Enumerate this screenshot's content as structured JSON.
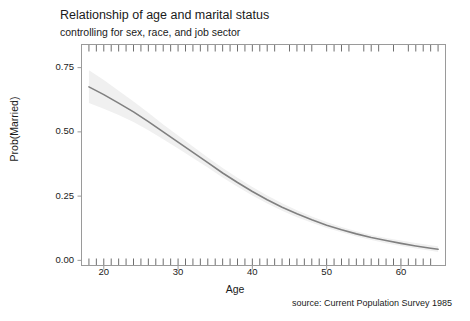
{
  "chart_data": {
    "type": "line",
    "title": "Relationship of age and marital status",
    "subtitle": "controlling for sex, race, and job sector",
    "caption": "source: Current Population Survey 1985",
    "xlabel": "Age",
    "ylabel": "Prob(Married)",
    "xlim": [
      17,
      66
    ],
    "ylim": [
      -0.02,
      0.84
    ],
    "grid": false,
    "legend": null,
    "line_color": "#808080",
    "band_color": "#f0f0f0",
    "frame_color": "#9a9a9a",
    "rug_color": "#6f6f6f",
    "xticks": [
      20,
      30,
      40,
      50,
      60
    ],
    "xtick_labels": [
      "20",
      "30",
      "40",
      "50",
      "60"
    ],
    "yticks": [
      0.0,
      0.25,
      0.5,
      0.75
    ],
    "ytick_labels": [
      "0.00",
      "0.25",
      "0.50",
      "0.75"
    ],
    "series": [
      {
        "name": "Prob(Married)",
        "x": [
          18,
          20,
          22,
          24,
          26,
          28,
          30,
          32,
          34,
          36,
          38,
          40,
          42,
          44,
          46,
          48,
          50,
          52,
          54,
          56,
          58,
          60,
          62,
          64,
          65
        ],
        "values": [
          0.675,
          0.645,
          0.612,
          0.578,
          0.54,
          0.5,
          0.46,
          0.42,
          0.38,
          0.34,
          0.303,
          0.268,
          0.236,
          0.207,
          0.181,
          0.158,
          0.137,
          0.119,
          0.103,
          0.089,
          0.077,
          0.066,
          0.056,
          0.047,
          0.043
        ]
      }
    ],
    "confidence_band": {
      "name": "95% confidence interval",
      "x": [
        18,
        20,
        22,
        24,
        26,
        28,
        30,
        32,
        34,
        36,
        38,
        40,
        42,
        44,
        46,
        48,
        50,
        52,
        54,
        56,
        58,
        60,
        62,
        64,
        65
      ],
      "lower": [
        0.612,
        0.59,
        0.566,
        0.538,
        0.506,
        0.471,
        0.435,
        0.398,
        0.361,
        0.322,
        0.286,
        0.252,
        0.221,
        0.193,
        0.168,
        0.146,
        0.126,
        0.109,
        0.093,
        0.079,
        0.067,
        0.056,
        0.046,
        0.037,
        0.033
      ],
      "upper": [
        0.74,
        0.702,
        0.66,
        0.618,
        0.574,
        0.529,
        0.486,
        0.443,
        0.4,
        0.359,
        0.321,
        0.285,
        0.252,
        0.222,
        0.195,
        0.171,
        0.149,
        0.13,
        0.113,
        0.099,
        0.087,
        0.077,
        0.068,
        0.059,
        0.055
      ]
    },
    "rug_top": {
      "position": "top",
      "values": [
        18,
        19,
        20,
        21,
        22,
        23,
        24,
        25,
        26,
        27,
        28,
        29,
        30,
        31,
        32,
        33,
        34,
        35,
        36,
        37,
        38,
        39,
        40,
        41,
        42,
        43,
        45,
        46,
        47,
        48,
        50,
        51,
        52,
        53,
        55,
        56,
        57,
        59,
        61,
        62,
        63,
        64,
        65
      ]
    },
    "rug_bottom": {
      "position": "bottom",
      "values": [
        18,
        19,
        20,
        21,
        22,
        23,
        24,
        25,
        26,
        27,
        28,
        29,
        30,
        31,
        32,
        33,
        34,
        35,
        36,
        37,
        38,
        39,
        40,
        41,
        42,
        43,
        44,
        45,
        46,
        47,
        48,
        49,
        50,
        51,
        52,
        53,
        54,
        55,
        56,
        57,
        58,
        59,
        60,
        61,
        62,
        63,
        64
      ]
    }
  }
}
